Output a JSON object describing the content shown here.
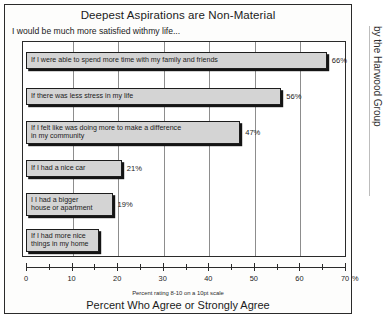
{
  "chart_data": {
    "type": "bar",
    "orientation": "horizontal",
    "title": "Deepest Aspirations are Non-Material",
    "subtitle": "I would be much more satisfied withmy life...",
    "xlabel": "Percent Who Agree or Strongly Agree",
    "ylabel": "",
    "footnote": "Percent rating 8-10 on a 10pt scale",
    "axis_unit": "%",
    "xlim": [
      0,
      70
    ],
    "xtick_step_major": 10,
    "xtick_step_minor": 5,
    "grid": "vertical",
    "legend": "none",
    "categories": [
      "If I were able to spend more time with my family and friends",
      "If there was less stress in my life",
      "If I felt like  was doing more to make a difference\nin my community",
      "If I had a nice car",
      "I I had a bigger\nhouse or apartment",
      "If I had more nice\nthings in my home"
    ],
    "values": [
      66,
      56,
      47,
      21,
      19,
      16
    ],
    "value_labels": [
      "66%",
      "56%",
      "47%",
      "21%",
      "19%",
      ""
    ],
    "xticks": [
      {
        "value": 0,
        "label": "0",
        "major": true
      },
      {
        "value": 5,
        "label": "",
        "major": false
      },
      {
        "value": 10,
        "label": "10",
        "major": true
      },
      {
        "value": 15,
        "label": "",
        "major": false
      },
      {
        "value": 20,
        "label": "20",
        "major": true
      },
      {
        "value": 25,
        "label": "",
        "major": false
      },
      {
        "value": 30,
        "label": "30",
        "major": true
      },
      {
        "value": 35,
        "label": "",
        "major": false
      },
      {
        "value": 40,
        "label": "40",
        "major": true
      },
      {
        "value": 45,
        "label": "",
        "major": false
      },
      {
        "value": 50,
        "label": "50",
        "major": true
      },
      {
        "value": 55,
        "label": "",
        "major": false
      },
      {
        "value": 60,
        "label": "60",
        "major": true
      },
      {
        "value": 65,
        "label": "",
        "major": false
      },
      {
        "value": 70,
        "label": "70",
        "major": true
      }
    ],
    "gridlines": [
      10,
      20,
      30,
      40,
      50,
      60
    ],
    "colors": {
      "bar_fill": "#d4d4d4",
      "bar_outline": "#1d1d1d",
      "bar_shadow": "#141414",
      "frame": "#2b2b2b",
      "gridline": "#8d8d8d",
      "text": "#1b1b1b"
    }
  },
  "source_credit": "by the Harwood Group"
}
